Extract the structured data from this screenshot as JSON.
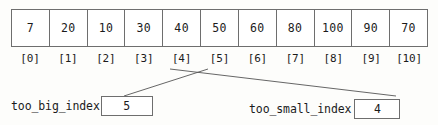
{
  "diagram": {
    "type": "array-index-pointer-diagram",
    "array": {
      "name": "array-row",
      "values": [
        "7",
        "20",
        "10",
        "30",
        "40",
        "50",
        "60",
        "80",
        "100",
        "90",
        "70"
      ],
      "indices": [
        "[0]",
        "[1]",
        "[2]",
        "[3]",
        "[4]",
        "[5]",
        "[6]",
        "[7]",
        "[8]",
        "[9]",
        "[10]"
      ]
    },
    "pointers": [
      {
        "name": "too-big-index",
        "label": "too_big_index",
        "value": "5",
        "points_to_index": "[5]"
      },
      {
        "name": "too-small-index",
        "label": "too_small_index",
        "value": "4",
        "points_to_index": "[4]"
      }
    ],
    "colors": {
      "background": "#fdfdfb",
      "cell_fill": "#ffffff",
      "border": "#6e6e6e",
      "text": "#1b1b1b",
      "connector": "#555555"
    }
  }
}
